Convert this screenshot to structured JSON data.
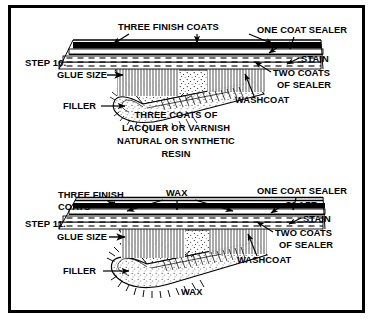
{
  "figure": {
    "border_color": "#000000",
    "background_color": "#ffffff",
    "ink_color": "#000000"
  },
  "panels": [
    {
      "id": "step-10",
      "step_label": "STEP 10.",
      "labels": {
        "three_finish_coats": "THREE FINISH COATS",
        "one_coat_sealer": "ONE COAT SEALER",
        "glaze": "GLAZE",
        "stain": "STAIN",
        "two_coats_line1": "TWO COATS",
        "two_coats_line2": "OF SEALER",
        "washcoat": "WASHCOAT",
        "glue_size": "GLUE SIZE",
        "filler": "FILLER"
      },
      "caption": [
        "THREE COATS OF",
        "LACQUER OR VARNISH",
        "NATURAL OR SYNTHETIC",
        "RESIN"
      ]
    },
    {
      "id": "step-11",
      "step_label": "STEP 11.",
      "labels": {
        "three_finish_line1": "THREE FINISH",
        "three_finish_line2": "COATS",
        "wax_top": "WAX",
        "one_coat_sealer": "ONE COAT SEALER",
        "glaze": "GLAZE",
        "stain": "STAIN",
        "two_coats_line1": "TWO COATS",
        "two_coats_line2": "OF SEALER",
        "washcoat": "WASHCOAT",
        "glue_size": "GLUE SIZE",
        "filler": "FILLER",
        "wax_bottom": "WAX"
      }
    }
  ]
}
